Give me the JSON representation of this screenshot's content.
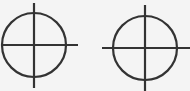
{
  "figure": {
    "stroke_color": "#333333",
    "background": "#f4f4f4",
    "symbols": [
      {
        "name": "crosshair-left",
        "cx": 34,
        "cy": 45,
        "r": 32,
        "hline": [
          1,
          78
        ],
        "vline": [
          3,
          88
        ]
      },
      {
        "name": "crosshair-right",
        "cx": 145,
        "cy": 48,
        "r": 32,
        "hline": [
          102,
          190
        ],
        "vline": [
          5,
          91
        ]
      }
    ]
  }
}
